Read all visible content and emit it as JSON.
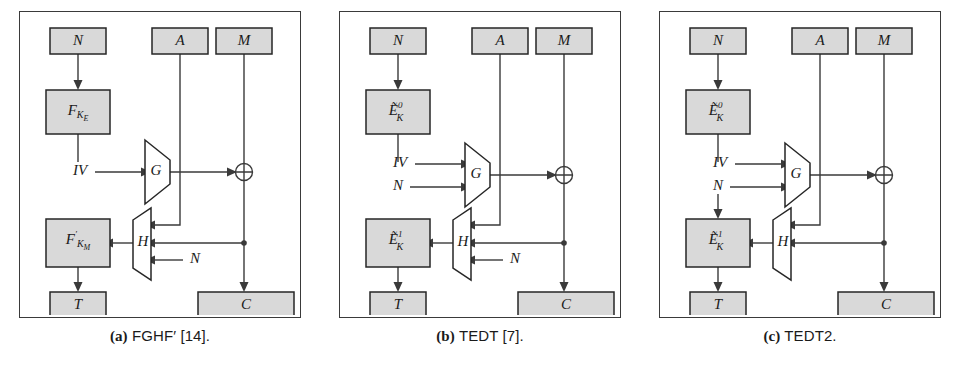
{
  "figure": {
    "panels": [
      {
        "id": "fghf-prime",
        "caption_tag": "(a)",
        "caption_text": "FGHF′ [14].",
        "nodes": {
          "nonce_top": "N",
          "assoc_data": "A",
          "message": "M",
          "upper_primitive": "F",
          "upper_primitive_sub": "K",
          "upper_primitive_subsub": "E",
          "upper_primitive_prime": "",
          "lower_primitive": "F",
          "lower_primitive_prime": "′",
          "lower_primitive_sub": "K",
          "lower_primitive_subsub": "M",
          "iv": "IV",
          "g_func": "G",
          "h_func": "H",
          "h_nonce_input": "N",
          "tag": "T",
          "ciphertext": "C",
          "xor": "⊕"
        },
        "g_inputs": [
          "IV"
        ],
        "has_h_nonce_label": true,
        "has_nonce_down_to_lower": false
      },
      {
        "id": "tedt",
        "caption_tag": "(b)",
        "caption_text": "TEDT [7].",
        "nodes": {
          "nonce_top": "N",
          "assoc_data": "A",
          "message": "M",
          "upper_primitive": "Ẽ",
          "upper_primitive_sub": "K",
          "upper_primitive_sup": "0",
          "lower_primitive": "Ẽ",
          "lower_primitive_sub": "K",
          "lower_primitive_sup": "1",
          "iv": "IV",
          "g_nonce_input": "N",
          "g_func": "G",
          "h_func": "H",
          "h_nonce_input": "N",
          "tag": "T",
          "ciphertext": "C",
          "xor": "⊕"
        },
        "g_inputs": [
          "IV",
          "N"
        ],
        "has_h_nonce_label": true,
        "has_nonce_down_to_lower": false
      },
      {
        "id": "tedt2",
        "caption_tag": "(c)",
        "caption_text": "TEDT2.",
        "nodes": {
          "nonce_top": "N",
          "assoc_data": "A",
          "message": "M",
          "upper_primitive": "Ẽ",
          "upper_primitive_sub": "K",
          "upper_primitive_sup": "0",
          "lower_primitive": "Ẽ",
          "lower_primitive_sub": "K",
          "lower_primitive_sup": "1",
          "iv": "IV",
          "g_nonce_input": "N",
          "g_func": "G",
          "h_func": "H",
          "tag": "T",
          "ciphertext": "C",
          "xor": "⊕"
        },
        "g_inputs": [
          "IV",
          "N"
        ],
        "has_h_nonce_label": false,
        "has_nonce_down_to_lower": true
      }
    ]
  },
  "colors": {
    "node_fill": "#d9d9d9",
    "node_stroke": "#262626",
    "wire": "#3a3a3a",
    "panel_border": "#3a3a3a",
    "background": "#ffffff",
    "text": "#1a1a1a"
  }
}
